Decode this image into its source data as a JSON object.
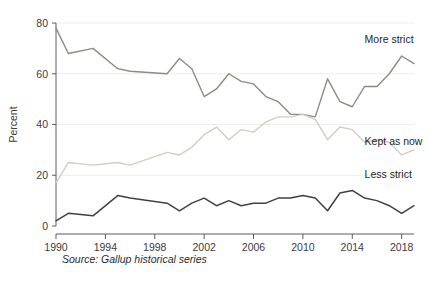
{
  "source_note": "Source: Gallup historical series",
  "chart_data": {
    "type": "line",
    "title": "",
    "subtitle": "",
    "xlabel": "",
    "ylabel": "Percent",
    "xlim": [
      1990,
      2019
    ],
    "ylim": [
      0,
      80
    ],
    "grid": true,
    "legend_position": "inline-right",
    "x_ticks": [
      1990,
      1994,
      1998,
      2002,
      2006,
      2010,
      2014,
      2018
    ],
    "x_tick_labels": [
      "1990",
      "1994",
      "1998",
      "2002",
      "2006",
      "2010",
      "2014",
      "2018"
    ],
    "y_ticks": [
      0,
      20,
      40,
      60,
      80
    ],
    "y_tick_labels": [
      "0",
      "20",
      "40",
      "60",
      "80"
    ],
    "x": [
      1990,
      1991,
      1993,
      1995,
      1996,
      1999,
      2000,
      2001,
      2002,
      2003,
      2004,
      2005,
      2006,
      2007,
      2008,
      2009,
      2010,
      2011,
      2012,
      2013,
      2014,
      2015,
      2016,
      2017,
      2018,
      2019
    ],
    "series": [
      {
        "name": "More strict",
        "color": "#8c8c84",
        "label_x": 2015.0,
        "label_y": 72,
        "values": [
          78,
          68,
          70,
          62,
          61,
          60,
          66,
          62,
          51,
          54,
          60,
          57,
          56,
          51,
          49,
          44,
          44,
          43,
          58,
          49,
          47,
          55,
          55,
          60,
          67,
          64
        ]
      },
      {
        "name": "Kept as now",
        "color": "#cfcfc6",
        "label_x": 2015.0,
        "label_y": 32,
        "values": [
          17,
          25,
          24,
          25,
          24,
          29,
          28,
          31,
          36,
          39,
          34,
          38,
          37,
          41,
          43,
          43,
          44,
          42,
          34,
          39,
          38,
          33,
          34,
          33,
          28,
          30
        ]
      },
      {
        "name": "Less strict",
        "color": "#3d4440",
        "label_x": 2015.0,
        "label_y": 19,
        "values": [
          2,
          5,
          4,
          12,
          11,
          9,
          6,
          9,
          11,
          8,
          10,
          8,
          9,
          9,
          11,
          11,
          12,
          11,
          6,
          13,
          14,
          11,
          10,
          8,
          5,
          8
        ]
      }
    ]
  }
}
